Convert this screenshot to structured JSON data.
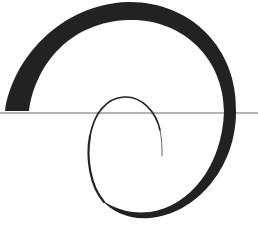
{
  "diagram": {
    "type": "spiral",
    "background_color": "#ffffff",
    "stroke_color": "#222222",
    "baseline": {
      "y": 113,
      "x_start": 0,
      "x_end": 258,
      "color": "#b4b4b4",
      "width": 2
    },
    "spiral": {
      "description": "Tapered spiral stroke, thick at outer left start, thinning toward inner end",
      "start_point": [
        17,
        111
      ],
      "end_point": [
        162,
        155
      ]
    }
  }
}
